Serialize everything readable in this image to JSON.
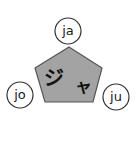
{
  "diagram": {
    "center": {
      "label": "ジャ",
      "chars": [
        "ジ",
        "ャ"
      ],
      "shape": "pentagon",
      "fill": "#a3a3a3",
      "stroke": "#555555"
    },
    "nodes": [
      {
        "label": "ja",
        "position": "top"
      },
      {
        "label": "jo",
        "position": "left"
      },
      {
        "label": "ju",
        "position": "right"
      }
    ],
    "node_fill": "#ffffff",
    "node_stroke": "#333333"
  }
}
